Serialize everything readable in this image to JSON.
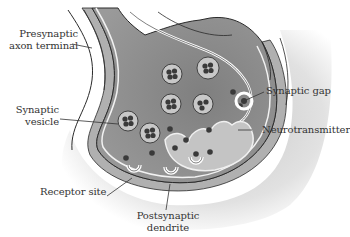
{
  "diagram": {
    "labels": {
      "presynaptic_line1": "Presynaptic",
      "presynaptic_line2": "axon terminal",
      "vesicle_line1": "Synaptic",
      "vesicle_line2": "vesicle",
      "synaptic_gap": "Synaptic gap",
      "neurotransmitter": "Neurotransmitter",
      "receptor_site": "Receptor site",
      "postsynaptic_line1": "Postsynaptic",
      "postsynaptic_line2": "dendrite"
    },
    "colors": {
      "background": "#ffffff",
      "terminal_fill": "#8a8a8a",
      "cleft_fill": "#b5b5b5",
      "dendrite_fill": "#d6d6d6",
      "vesicle_fill": "#c8c8c8",
      "molecule": "#3a3a3a",
      "outline": "#2a2a2a",
      "text": "#333333"
    }
  }
}
